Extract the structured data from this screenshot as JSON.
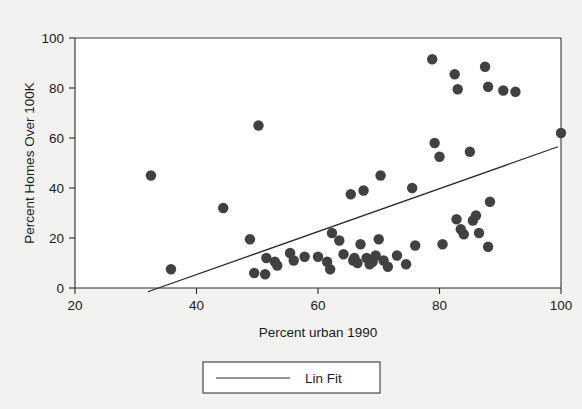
{
  "chart_data": {
    "type": "scatter",
    "title": "",
    "xlabel": "Percent urban 1990",
    "ylabel": "Percent Homes Over 100K",
    "xlim": [
      20,
      100
    ],
    "ylim": [
      0,
      100
    ],
    "xticks": [
      20,
      40,
      60,
      80,
      100
    ],
    "yticks": [
      0,
      20,
      40,
      60,
      80,
      100
    ],
    "xtick_labels": [
      "20",
      "40",
      "60",
      "80",
      "100"
    ],
    "ytick_labels": [
      "0",
      "20",
      "40",
      "60",
      "80",
      "100"
    ],
    "grid": false,
    "legend_position": "below-axes-center",
    "marker_color": "#414141",
    "line_color": "#2b2b2b",
    "plot_background": "#ffffff",
    "page_background": "#f2f2f0",
    "legend": [
      {
        "label": "Lin Fit",
        "type": "line",
        "color": "#2b2b2b"
      }
    ],
    "series": [
      {
        "name": "States",
        "type": "scatter",
        "points": [
          [
            32.5,
            45.0
          ],
          [
            35.8,
            7.5
          ],
          [
            44.4,
            32.0
          ],
          [
            48.8,
            19.5
          ],
          [
            50.2,
            65.0
          ],
          [
            49.5,
            6.0
          ],
          [
            51.3,
            5.5
          ],
          [
            51.5,
            12.0
          ],
          [
            52.9,
            10.5
          ],
          [
            53.3,
            9.0
          ],
          [
            55.4,
            14.0
          ],
          [
            56.0,
            11.0
          ],
          [
            57.8,
            12.5
          ],
          [
            60.0,
            12.5
          ],
          [
            61.5,
            10.5
          ],
          [
            62.3,
            22.0
          ],
          [
            62.0,
            7.5
          ],
          [
            63.5,
            19.0
          ],
          [
            64.2,
            13.5
          ],
          [
            65.4,
            37.5
          ],
          [
            65.8,
            11.0
          ],
          [
            66.0,
            12.0
          ],
          [
            66.5,
            10.0
          ],
          [
            67.5,
            39.0
          ],
          [
            67.0,
            17.5
          ],
          [
            68.0,
            12.0
          ],
          [
            68.5,
            9.5
          ],
          [
            69.0,
            10.5
          ],
          [
            69.5,
            13.0
          ],
          [
            70.3,
            45.0
          ],
          [
            70.0,
            19.5
          ],
          [
            70.8,
            11.0
          ],
          [
            71.5,
            8.5
          ],
          [
            73.0,
            13.0
          ],
          [
            75.5,
            40.0
          ],
          [
            74.5,
            9.5
          ],
          [
            76.0,
            17.0
          ],
          [
            78.8,
            91.5
          ],
          [
            79.2,
            58.0
          ],
          [
            80.0,
            52.5
          ],
          [
            80.5,
            17.5
          ],
          [
            82.5,
            85.5
          ],
          [
            83.0,
            79.5
          ],
          [
            82.8,
            27.5
          ],
          [
            83.5,
            23.5
          ],
          [
            84.0,
            21.5
          ],
          [
            85.0,
            54.5
          ],
          [
            85.5,
            27.0
          ],
          [
            86.0,
            29.0
          ],
          [
            86.5,
            22.0
          ],
          [
            87.5,
            88.5
          ],
          [
            88.0,
            80.5
          ],
          [
            88.3,
            34.5
          ],
          [
            88.0,
            16.5
          ],
          [
            90.5,
            79.0
          ],
          [
            92.5,
            78.5
          ],
          [
            100.0,
            62.0
          ]
        ]
      }
    ],
    "fit_line": {
      "name": "Lin Fit",
      "x_start": 32.0,
      "y_start": -1.5,
      "x_end": 99.5,
      "y_end": 56.5
    }
  }
}
